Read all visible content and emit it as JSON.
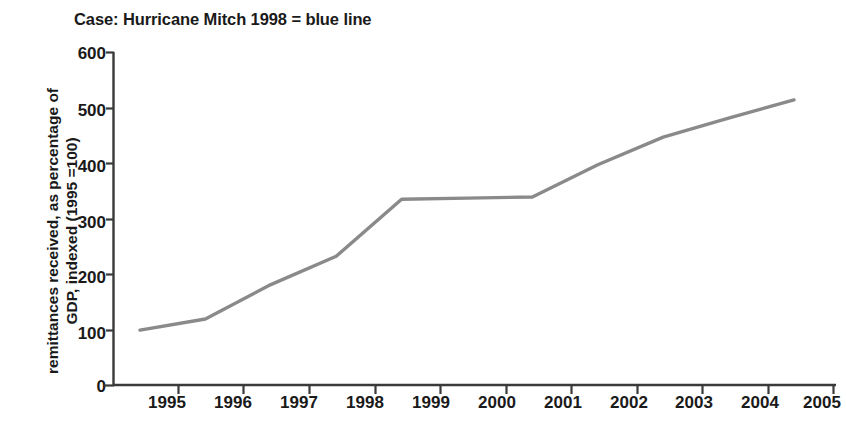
{
  "chart_data": {
    "type": "line",
    "title": "Case: Hurricane Mitch 1998 = blue line",
    "xlabel": "",
    "ylabel": "remittances received, as percentage of GDP, indexed (1995 =100)",
    "ylabel_lines": [
      "remittances received, as percentage of",
      "GDP, indexed (1995 =100)"
    ],
    "categories": [
      "1995",
      "1996",
      "1997",
      "1998",
      "1999",
      "2000",
      "2001",
      "2002",
      "2003",
      "2004",
      "2005"
    ],
    "series": [
      {
        "name": "Hurricane Mitch 1998",
        "color": "#8a8a8a",
        "values": [
          100,
          120,
          182,
          233,
          336,
          338,
          340,
          398,
          448,
          482,
          515
        ]
      }
    ],
    "ylim": [
      0,
      600
    ],
    "yticks": [
      0,
      100,
      200,
      300,
      400,
      500,
      600
    ],
    "ytick_labels": [
      "0",
      "100",
      "200",
      "300",
      "400",
      "500",
      "600"
    ],
    "grid": false,
    "legend": "none",
    "annotations": []
  },
  "style": {
    "axis_color": "#3a3a3a",
    "line_color": "#8a8a8a",
    "text_color": "#1a1a1a",
    "background": "#ffffff"
  }
}
